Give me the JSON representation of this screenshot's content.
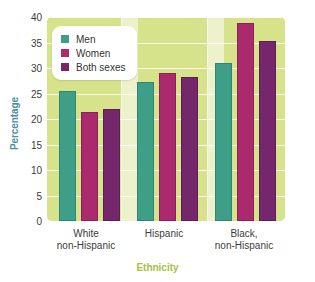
{
  "chart_data": {
    "type": "bar",
    "title": "",
    "xlabel": "Ethnicity",
    "ylabel": "Percentage",
    "categories": [
      "White non-Hispanic",
      "Hispanic",
      "Black, non-Hispanic"
    ],
    "category_lines": [
      [
        "White",
        "non-Hispanic"
      ],
      [
        "Hispanic",
        ""
      ],
      [
        "Black,",
        "non-Hispanic"
      ]
    ],
    "series": [
      {
        "name": "Men",
        "color": "#3f9e88",
        "values": [
          25.5,
          27.3,
          31.0
        ]
      },
      {
        "name": "Women",
        "color": "#ab2a6d",
        "values": [
          21.3,
          29.1,
          38.8
        ]
      },
      {
        "name": "Both sexes",
        "color": "#76276c",
        "values": [
          22.0,
          28.3,
          35.2
        ]
      }
    ],
    "ylim": [
      0,
      40
    ],
    "ytick_labels": [
      "0",
      "5",
      "10",
      "15",
      "20",
      "25",
      "30",
      "35",
      "40"
    ],
    "ytick_values": [
      0,
      5,
      10,
      15,
      20,
      25,
      30,
      35,
      40
    ],
    "grid": true,
    "legend_position": "top-left"
  },
  "legend": {
    "entries": [
      {
        "label": "Men"
      },
      {
        "label": "Women"
      },
      {
        "label": "Both sexes"
      }
    ]
  },
  "axes": {
    "y_title": "Percentage",
    "x_title": "Ethnicity"
  },
  "colors": {
    "men": "#3f9e88",
    "women": "#ab2a6d",
    "both": "#76276c",
    "panel_group": "#d7e38a",
    "panel_gap": "#edf2cd",
    "y_title": "#4e8fa3",
    "x_title": "#a8c03f"
  }
}
